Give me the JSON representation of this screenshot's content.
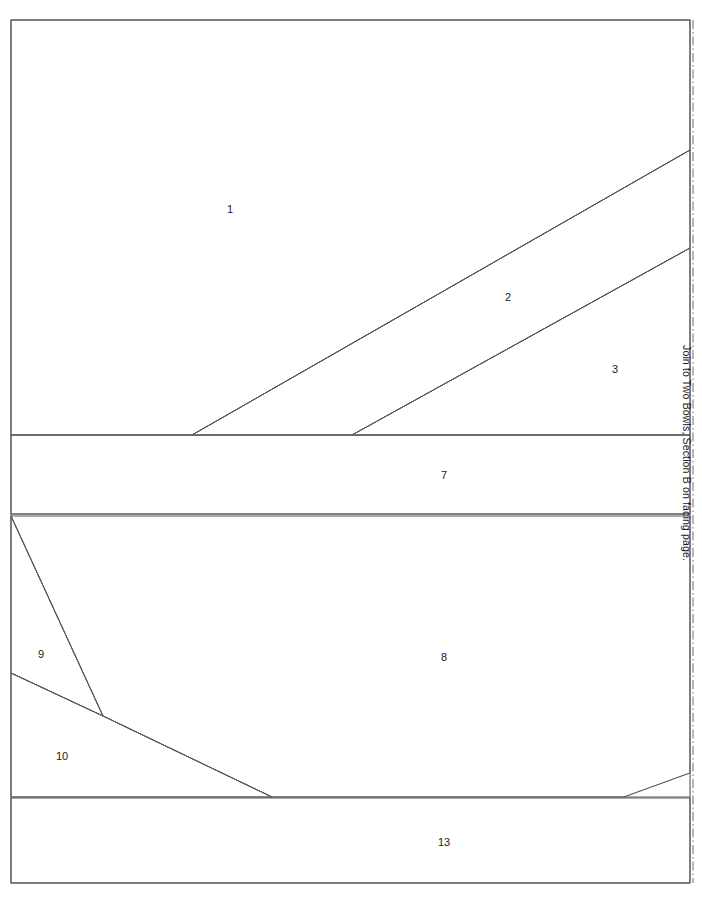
{
  "page": {
    "width": 702,
    "height": 903,
    "background": "#ffffff",
    "border_color": "#59595b",
    "fold_line_color": "#6e6e70"
  },
  "annotations": {
    "join_note": "Join to Two Bowls, Section B on facing page."
  },
  "palette": {
    "white": "#ffffff",
    "light_gray": "#e3e3e3",
    "mid_gray": "#c3c3c3",
    "line": "#59595b",
    "label_text": "#1a1a1a"
  },
  "regions": [
    {
      "id": "1",
      "label": "1",
      "fill": "#ffffff",
      "label_x": 230,
      "label_y": 210,
      "points": "11,20 690,20 690,150 192,435 11,435"
    },
    {
      "id": "2",
      "label": "2",
      "fill": "#c3c3c3",
      "label_x": 508,
      "label_y": 298,
      "points": "690,150 690,248 352,435 192,435"
    },
    {
      "id": "3",
      "label": "3",
      "fill": "#e3e3e3",
      "label_x": 615,
      "label_y": 370,
      "points": "690,248 690,435 352,435"
    },
    {
      "id": "7",
      "label": "7",
      "fill": "#c3c3c3",
      "label_x": 444,
      "label_y": 476,
      "points": "11,435 690,435 690,514 11,514"
    },
    {
      "id": "8",
      "label": "8",
      "fill": "#e3e3e3",
      "label_x": 444,
      "label_y": 658,
      "points": "11,516 690,516 690,773 624,797 272,797 103,716"
    },
    {
      "id": "9",
      "label": "9",
      "fill": "#ffffff",
      "label_x": 41,
      "label_y": 655,
      "points": "11,516 103,716 11,673"
    },
    {
      "id": "10",
      "label": "10",
      "fill": "#ffffff",
      "label_x": 62,
      "label_y": 757,
      "points": "11,673 103,716 272,797 11,797"
    },
    {
      "id": "13",
      "label": "13",
      "fill": "#c3c3c3",
      "label_x": 444,
      "label_y": 843,
      "points": "11,798 690,798 690,883 11,883"
    }
  ],
  "unlabeled_regions": [
    {
      "id": "corner-white",
      "fill": "#ffffff",
      "points": "690,773 690,797 624,797"
    }
  ],
  "edges": [
    {
      "name": "edge-1-2",
      "d": "M 192,435 L 690,150"
    },
    {
      "name": "edge-2-3",
      "d": "M 352,435 L 690,248"
    },
    {
      "name": "edge-7-top",
      "d": "M 11,435 L 690,435"
    },
    {
      "name": "edge-7-bottom",
      "d": "M 11,514 L 690,514"
    },
    {
      "name": "edge-8-9",
      "d": "M 11,516 L 103,716"
    },
    {
      "name": "edge-9-10",
      "d": "M 11,673 L 103,716"
    },
    {
      "name": "edge-8-10",
      "d": "M 103,716 L 272,797"
    },
    {
      "name": "edge-8-corner",
      "d": "M 624,797 L 690,773"
    },
    {
      "name": "edge-13-top",
      "d": "M 11,797 L 690,797"
    }
  ]
}
